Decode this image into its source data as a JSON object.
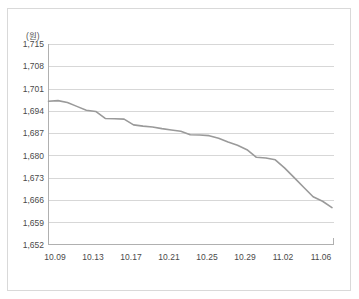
{
  "chart_data": {
    "type": "line",
    "title": "",
    "subtitle": "",
    "unit_label": "(원)",
    "xlabel": "",
    "ylabel": "",
    "ylim": [
      1652,
      1715
    ],
    "ytick_step": 7,
    "yticks": [
      "1,652",
      "1,659",
      "1,666",
      "1,673",
      "1,680",
      "1,687",
      "1,694",
      "1,701",
      "1,708",
      "1,715"
    ],
    "ytick_values": [
      1652,
      1659,
      1666,
      1673,
      1680,
      1687,
      1694,
      1701,
      1708,
      1715
    ],
    "xticks": [
      "10.09",
      "10.13",
      "10.17",
      "10.21",
      "10.25",
      "10.29",
      "11.02",
      "11.06"
    ],
    "grid": "horizontal",
    "legend": "none",
    "series": [
      {
        "name": "환율",
        "color": "#9a9a9a",
        "x": [
          "10.09",
          "10.10",
          "10.11",
          "10.12",
          "10.13",
          "10.14",
          "10.15",
          "10.16",
          "10.17",
          "10.18",
          "10.19",
          "10.20",
          "10.21",
          "10.22",
          "10.23",
          "10.24",
          "10.25",
          "10.26",
          "10.27",
          "10.28",
          "10.29",
          "10.30",
          "10.31",
          "11.01",
          "11.02",
          "11.03",
          "11.04",
          "11.05",
          "11.06",
          "11.07",
          "11.08"
        ],
        "values": [
          1697.0,
          1697.2,
          1696.6,
          1695.4,
          1694.2,
          1693.8,
          1691.6,
          1691.5,
          1691.4,
          1689.6,
          1689.2,
          1688.9,
          1688.4,
          1688.0,
          1687.6,
          1686.5,
          1686.4,
          1686.2,
          1685.4,
          1684.2,
          1683.2,
          1681.8,
          1679.4,
          1679.2,
          1678.6,
          1676.0,
          1673.0,
          1670.0,
          1667.0,
          1665.6,
          1663.6
        ]
      }
    ]
  },
  "axis": {
    "y_top_value": 1715,
    "y_bottom_value": 1652
  }
}
